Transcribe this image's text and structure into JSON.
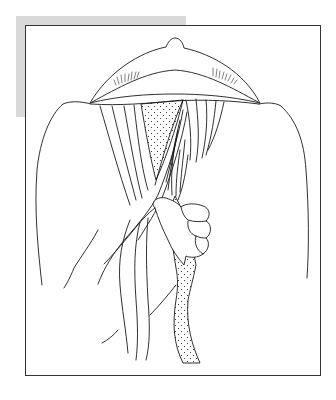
{
  "figure": {
    "elements": [
      "raised-flap-dome",
      "eyelashes",
      "shoulders",
      "dotted-tissue-strip",
      "fibrous-strands",
      "hand-grasping-strip"
    ],
    "colors": {
      "line": "#1a1a1a",
      "frame_border": "#333333",
      "shadow": "#d9d9d9",
      "background": "#ffffff"
    }
  }
}
